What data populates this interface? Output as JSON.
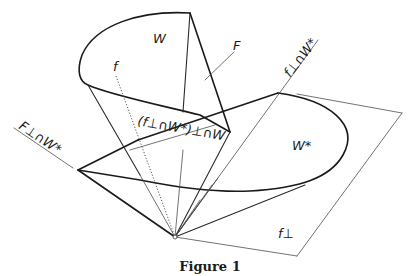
{
  "figure": {
    "caption": "Figure 1",
    "labels": {
      "W": "W",
      "F": "F",
      "f": "f",
      "W_star": "W*",
      "f_perp": "f⊥",
      "f_perp_cap_W_star": "f⊥∩W*",
      "F_perp_cap_W_star": "F⊥∩W*",
      "intersection": "(f⊥∩W*)⊥∩W"
    }
  }
}
